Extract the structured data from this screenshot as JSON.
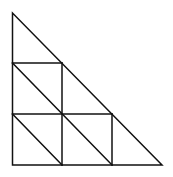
{
  "diagram": {
    "stroke_color": "#111111",
    "background": "#ffffff",
    "rows": 3,
    "small_triangle_count": 9
  }
}
